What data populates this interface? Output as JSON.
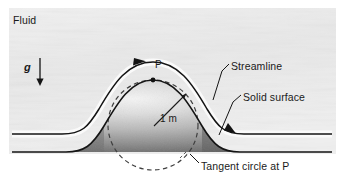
{
  "figure": {
    "labels": {
      "fluid": "Fluid",
      "gravity": "g",
      "point": "P",
      "radius": "1 m",
      "streamline": "Streamline",
      "solid_surface": "Solid surface",
      "tangent_circle": "Tangent circle at P"
    },
    "colors": {
      "line": "#1a1a1a",
      "fluid_bg": "#ededed",
      "hill_light": "#f2f2f2",
      "hill_dark": "#6b6b6b",
      "text": "#1a1a1a",
      "dashed": "#4d4d4d"
    },
    "geometry": {
      "ground_y": 152,
      "streamline_left_y": 134,
      "hill_peak": [
        153,
        80
      ],
      "tangent_circle_center": [
        153,
        125
      ],
      "tangent_circle_radius": 45
    }
  }
}
